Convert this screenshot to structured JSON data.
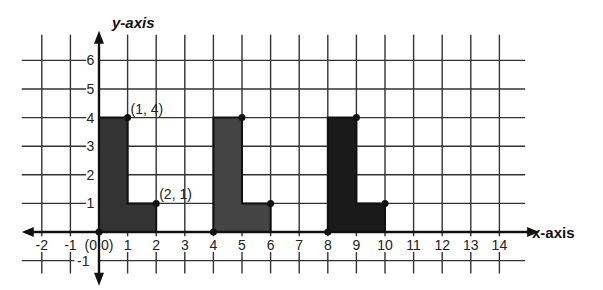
{
  "chart_data": {
    "type": "coordinate-grid",
    "title": "",
    "xlabel": "x-axis",
    "ylabel": "y-axis",
    "x_ticks": [
      -2,
      -1,
      0,
      1,
      2,
      3,
      4,
      5,
      6,
      7,
      8,
      9,
      10,
      11,
      12,
      13,
      14
    ],
    "x_tick_labels": [
      "-2",
      "-1",
      "(0,0)",
      "1",
      "2",
      "3",
      "4",
      "5",
      "6",
      "7",
      "8",
      "9",
      "10",
      "11",
      "12",
      "13",
      "14"
    ],
    "y_ticks": [
      -1,
      1,
      2,
      3,
      4,
      5,
      6
    ],
    "y_tick_labels": [
      "-1",
      "1",
      "2",
      "3",
      "4",
      "5",
      "6"
    ],
    "xlim": [
      -2.7,
      14.9
    ],
    "ylim": [
      -1.6,
      6.9
    ],
    "grid": true,
    "shapes": [
      {
        "name": "L-shape 1",
        "fill": "#333333",
        "vertices": [
          [
            0,
            0
          ],
          [
            0,
            4
          ],
          [
            1,
            4
          ],
          [
            1,
            1
          ],
          [
            2,
            1
          ],
          [
            2,
            0
          ]
        ],
        "marked_points": [
          [
            0,
            0
          ],
          [
            1,
            4
          ],
          [
            2,
            1
          ]
        ]
      },
      {
        "name": "L-shape 2",
        "fill": "#444444",
        "vertices": [
          [
            4,
            0
          ],
          [
            4,
            4
          ],
          [
            5,
            4
          ],
          [
            5,
            1
          ],
          [
            6,
            1
          ],
          [
            6,
            0
          ]
        ],
        "marked_points": [
          [
            4,
            0
          ],
          [
            5,
            4
          ],
          [
            6,
            1
          ]
        ]
      },
      {
        "name": "L-shape 3",
        "fill": "#1a1a1a",
        "vertices": [
          [
            8,
            0
          ],
          [
            8,
            4
          ],
          [
            9,
            4
          ],
          [
            9,
            1
          ],
          [
            10,
            1
          ],
          [
            10,
            0
          ]
        ],
        "marked_points": [
          [
            8,
            0
          ],
          [
            9,
            4
          ],
          [
            10,
            1
          ]
        ]
      }
    ],
    "annotations": [
      {
        "text": "(1, 4)",
        "x": 1,
        "y": 4
      },
      {
        "text": "(2, 1)",
        "x": 2,
        "y": 1
      }
    ]
  },
  "labels": {
    "x_axis": "x-axis",
    "y_axis": "y-axis"
  }
}
